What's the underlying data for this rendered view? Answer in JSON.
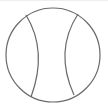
{
  "icon": {
    "name": "ball-icon",
    "stroke_color": "#6a6a6a",
    "background": "#ffffff"
  }
}
